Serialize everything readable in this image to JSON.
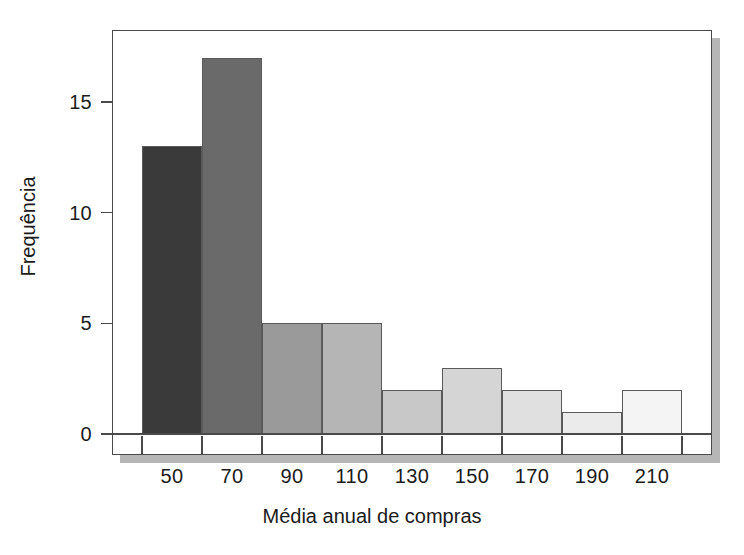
{
  "chart_data": {
    "type": "bar",
    "title": "",
    "subtitle": "",
    "xlabel": "Média anual de compras",
    "ylabel": "Frequência",
    "categories": [
      "50",
      "70",
      "90",
      "110",
      "130",
      "150",
      "170",
      "190",
      "210"
    ],
    "bin_edges": [
      40,
      60,
      80,
      100,
      120,
      140,
      160,
      180,
      200,
      220
    ],
    "values": [
      13,
      17,
      5,
      5,
      2,
      3,
      2,
      1,
      2
    ],
    "bar_colors": [
      "#3a3a3a",
      "#6a6a6a",
      "#9a9a9a",
      "#b5b5b5",
      "#c8c8c8",
      "#d5d5d5",
      "#e0e0e0",
      "#ebebeb",
      "#f4f4f4"
    ],
    "bar_edge_color": "#5a5a5a",
    "ylim": [
      0,
      18
    ],
    "xlim": [
      30,
      230
    ],
    "ytick_values": [
      0,
      5,
      10,
      15
    ],
    "ytick_labels": [
      "0",
      "5",
      "10",
      "15"
    ],
    "xtick_values": [
      40,
      60,
      80,
      100,
      120,
      140,
      160,
      180,
      200,
      220
    ],
    "grid": false,
    "legend": false,
    "legend_position": "none",
    "frame_color": "#4a4a4a",
    "background_color": "#ffffff",
    "shadow_color": "#b6b6b6",
    "annotations": []
  },
  "axes": {
    "y_ticks": [
      {
        "label": "0",
        "value": 0
      },
      {
        "label": "5",
        "value": 5
      },
      {
        "label": "10",
        "value": 10
      },
      {
        "label": "15",
        "value": 15
      }
    ],
    "x_ticks": [
      {
        "label": "50",
        "value": 50
      },
      {
        "label": "70",
        "value": 70
      },
      {
        "label": "90",
        "value": 90
      },
      {
        "label": "110",
        "value": 110
      },
      {
        "label": "130",
        "value": 130
      },
      {
        "label": "150",
        "value": 150
      },
      {
        "label": "170",
        "value": 170
      },
      {
        "label": "190",
        "value": 190
      },
      {
        "label": "210",
        "value": 210
      }
    ]
  }
}
